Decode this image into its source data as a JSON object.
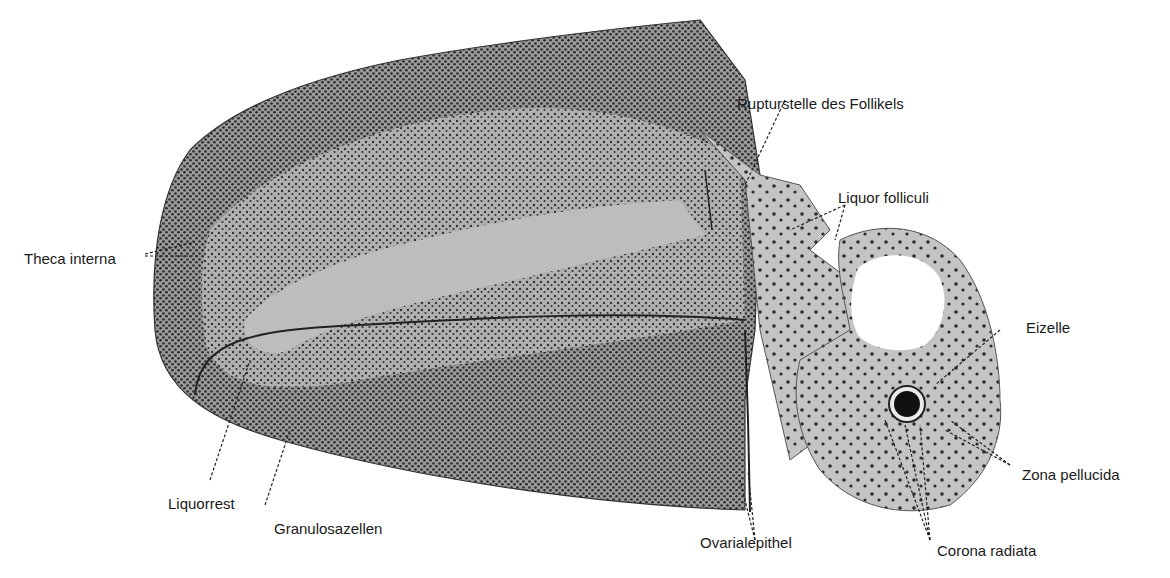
{
  "figure": {
    "labels": {
      "theca_interna": "Theca interna",
      "rupturstelle": "Rupturstelle des Follikels",
      "liquor_folliculi": "Liquor folliculi",
      "eizelle": "Eizelle",
      "zona_pellucida": "Zona pellucida",
      "corona_radiata": "Corona radiata",
      "ovarialepithel": "Ovarialepithel",
      "granulosazellen": "Granulosazellen",
      "liquorrest": "Liquorrest"
    },
    "colors": {
      "tissue_dark": "#4a4a4a",
      "tissue_mid": "#8a8a8a",
      "tissue_light": "#c8c8c8",
      "fluid": "#bdbdbd",
      "egg": "#111111",
      "line": "#222222"
    }
  }
}
